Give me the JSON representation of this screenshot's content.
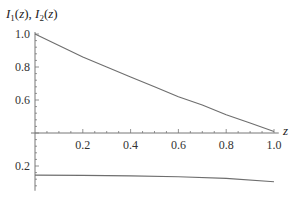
{
  "chart_data": {
    "type": "line",
    "title": "",
    "ylabel": "I1(z), I2(z)",
    "ylabel_parts": {
      "f1": "I",
      "s1": "1",
      "a1": "(z), ",
      "f2": "I",
      "s2": "2",
      "a2": "(z)"
    },
    "xlabel": "z",
    "xlim": [
      0,
      1.0
    ],
    "ylim": [
      0.05,
      1.0
    ],
    "x_axis_crossing_y": 0.4,
    "grid": false,
    "legend": null,
    "x_ticks": [
      "0.2",
      "0.4",
      "0.6",
      "0.8",
      "1.0"
    ],
    "y_ticks_upper": [
      "1.0",
      "0.8",
      "0.6"
    ],
    "y_ticks_lower": [
      "0.2"
    ],
    "series": [
      {
        "name": "I1(z)",
        "x": [
          0.0,
          0.1,
          0.2,
          0.3,
          0.4,
          0.5,
          0.6,
          0.7,
          0.8,
          0.9,
          1.0
        ],
        "values": [
          1.0,
          0.93,
          0.86,
          0.8,
          0.74,
          0.68,
          0.62,
          0.57,
          0.51,
          0.46,
          0.41
        ]
      },
      {
        "name": "I2(z)",
        "x": [
          0.0,
          0.2,
          0.4,
          0.6,
          0.8,
          1.0
        ],
        "values": [
          0.145,
          0.143,
          0.14,
          0.135,
          0.125,
          0.105
        ]
      }
    ]
  }
}
